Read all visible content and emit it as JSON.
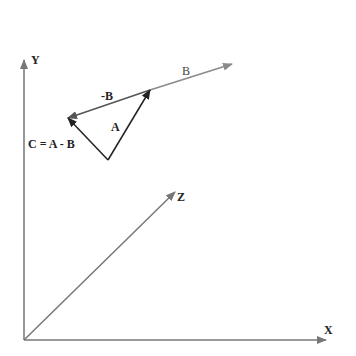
{
  "diagram": {
    "colors": {
      "axis": "#777777",
      "vector_b": "#8a8a8a",
      "vector_neg_b": "#555555",
      "vector_a": "#222222",
      "vector_c": "#222222",
      "text": "#222222"
    },
    "axes": {
      "x_label": "X",
      "y_label": "Y",
      "z_label": "Z"
    },
    "vectors": {
      "b_label": "B",
      "neg_b_label": "-B",
      "a_label": "A",
      "c_label": "C = A - B"
    }
  }
}
